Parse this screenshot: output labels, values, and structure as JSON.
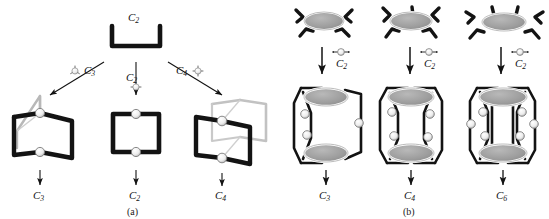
{
  "figure": {
    "background_color": "#ffffff",
    "ink_color": "#131313",
    "node_fill_color": "#f2f2f2",
    "ligand_fill_color": "#a9a9a9",
    "ghost_stroke_color": "#b8b8b8"
  },
  "panel_a": {
    "caption": "(a)",
    "precursor": {
      "name": "bracket-ligand",
      "symmetry_label": "C",
      "symmetry_sub": "2",
      "label_full": "C2"
    },
    "branches": [
      {
        "id": "left",
        "node_glyph": "three-connector-node",
        "symmetry_label": "C",
        "symmetry_sub": "3",
        "label_full": "C3",
        "product_label": "C",
        "product_sub": "3",
        "product_full": "C3",
        "product_name": "trigonal-prism-cage",
        "ligand_count": 3,
        "node_count": 2
      },
      {
        "id": "middle",
        "node_glyph": "two-connector-node",
        "symmetry_label": "C",
        "symmetry_sub": "2",
        "label_full": "C2",
        "product_label": "C",
        "product_sub": "2",
        "product_full": "C2",
        "product_name": "rectangular-macrocycle",
        "ligand_count": 2,
        "node_count": 2
      },
      {
        "id": "right",
        "node_glyph": "four-connector-node",
        "symmetry_label": "C",
        "symmetry_sub": "4",
        "label_full": "C4",
        "product_label": "C",
        "product_sub": "4",
        "product_full": "C4",
        "product_name": "square-prism-cage",
        "ligand_count": 4,
        "node_count": 2
      }
    ]
  },
  "panel_b": {
    "caption": "(b)",
    "columns": [
      {
        "id": "left",
        "precursor_name": "four-armed-panel-ligand",
        "precursor_arms": 4,
        "arrow_node_glyph": "linear-two-connector-node",
        "arrow_label": "C",
        "arrow_sub": "2",
        "arrow_full": "C2",
        "product_label": "C",
        "product_sub": "3",
        "product_full": "C3",
        "product_name": "three-pillar-cage",
        "product_pillars": 3
      },
      {
        "id": "middle",
        "precursor_name": "five-armed-panel-ligand",
        "precursor_arms": 5,
        "arrow_node_glyph": "linear-two-connector-node",
        "arrow_label": "C",
        "arrow_sub": "2",
        "arrow_full": "C2",
        "product_label": "C",
        "product_sub": "4",
        "product_full": "C4",
        "product_name": "four-pillar-cage",
        "product_pillars": 4
      },
      {
        "id": "right",
        "precursor_name": "six-armed-panel-ligand",
        "precursor_arms": 6,
        "arrow_node_glyph": "linear-two-connector-node",
        "arrow_label": "C",
        "arrow_sub": "2",
        "arrow_full": "C2",
        "product_label": "C",
        "product_sub": "6",
        "product_full": "C6",
        "product_name": "six-pillar-cage",
        "product_pillars": 6
      }
    ]
  }
}
